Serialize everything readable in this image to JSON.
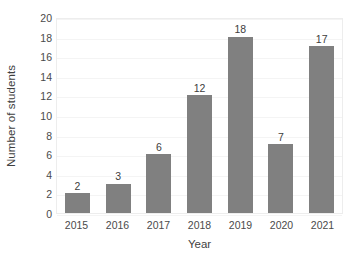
{
  "chart_data": {
    "type": "bar",
    "title": "",
    "subtitle": "",
    "xlabel": "Year",
    "ylabel": "Number of students",
    "categories": [
      "2015",
      "2016",
      "2017",
      "2018",
      "2019",
      "2020",
      "2021"
    ],
    "values": [
      2,
      3,
      6,
      12,
      18,
      7,
      17
    ],
    "data_labels": [
      "2",
      "3",
      "6",
      "12",
      "18",
      "7",
      "17"
    ],
    "ylim": [
      0,
      20
    ],
    "ytick_labels": [
      "20",
      "18",
      "16",
      "14",
      "12",
      "10",
      "8",
      "6",
      "4",
      "2",
      "0"
    ],
    "ytick_values": [
      20,
      18,
      16,
      14,
      12,
      10,
      8,
      6,
      4,
      2,
      0
    ],
    "ytick_step": 2,
    "grid": true,
    "grid_axis": "y",
    "legend": false,
    "legend_position": "none",
    "bar_color": "#808080",
    "text_color": "#404040",
    "gridline_color": "#f4f4f4",
    "plot_border_color": "#ededed",
    "background_color": "#ffffff"
  }
}
